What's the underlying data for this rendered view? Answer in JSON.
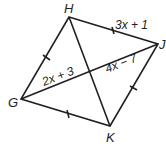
{
  "diagram": {
    "type": "quadrilateral-with-diagonals",
    "vertices": {
      "H": {
        "label": "H",
        "x": 69,
        "y": 17
      },
      "J": {
        "label": "J",
        "x": 158,
        "y": 44
      },
      "K": {
        "label": "K",
        "x": 110,
        "y": 126
      },
      "G": {
        "label": "G",
        "x": 21,
        "y": 99
      }
    },
    "sides": [
      {
        "from": "G",
        "to": "H",
        "tick_marks": 1
      },
      {
        "from": "H",
        "to": "J",
        "tick_marks": 1
      },
      {
        "from": "J",
        "to": "K",
        "tick_marks": 1
      },
      {
        "from": "K",
        "to": "G",
        "tick_marks": 1
      }
    ],
    "diagonals": [
      {
        "from": "H",
        "to": "K"
      },
      {
        "from": "G",
        "to": "J"
      }
    ],
    "expressions": {
      "HJ": "3x + 1",
      "G_to_center": "2x + 3",
      "center_to_J": "4x − 7"
    },
    "colors": {
      "line": "#231f20",
      "background": "#ffffff"
    }
  }
}
